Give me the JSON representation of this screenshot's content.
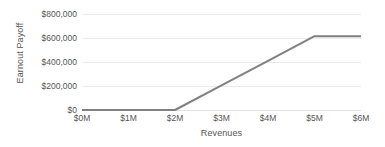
{
  "chart_data": {
    "type": "line",
    "title": "",
    "xlabel": "Revenues",
    "ylabel": "Earnout Payoff",
    "x": [
      0,
      1000000,
      2000000,
      3000000,
      4000000,
      5000000,
      6000000
    ],
    "values": [
      0,
      0,
      0,
      205000,
      410000,
      615000,
      615000
    ],
    "series": [
      {
        "name": "Earnout Payoff",
        "values": [
          0,
          0,
          0,
          205000,
          410000,
          615000,
          615000
        ]
      }
    ],
    "xlim": [
      0,
      6000000
    ],
    "ylim": [
      0,
      800000
    ],
    "x_tick_labels": [
      "$0M",
      "$1M",
      "$2M",
      "$3M",
      "$4M",
      "$5M",
      "$6M"
    ],
    "x_tick_values": [
      0,
      1000000,
      2000000,
      3000000,
      4000000,
      5000000,
      6000000
    ],
    "y_tick_labels": [
      "$0",
      "$200,000",
      "$400,000",
      "$600,000",
      "$800,000"
    ],
    "y_tick_values": [
      0,
      200000,
      400000,
      600000,
      800000
    ],
    "grid": true,
    "legend": "none",
    "breakpoints": [
      {
        "x": 2000000,
        "y": 0,
        "note": "threshold"
      },
      {
        "x": 5000000,
        "y": 615000,
        "note": "cap"
      }
    ],
    "line_color": "#808080",
    "grid_color": "#ececec",
    "text_color": "#555555",
    "background_color": "#ffffff"
  }
}
